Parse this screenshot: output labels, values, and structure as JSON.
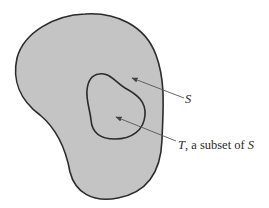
{
  "figure": {
    "type": "set-subset diagram",
    "colors": {
      "region_fill": "#c4c4c4",
      "outline": "#2b2b2b",
      "arrow": "#555555",
      "text": "#2a2a2a",
      "background": "#ffffff"
    },
    "sets": [
      {
        "id": "S",
        "role": "outer set"
      },
      {
        "id": "T",
        "role": "subset of S, drawn inside S"
      }
    ],
    "labels": {
      "outer": {
        "symbol": "S",
        "text": ""
      },
      "inner": {
        "symbol": "T",
        "text": ", a subset of ",
        "ref": "S"
      }
    }
  }
}
